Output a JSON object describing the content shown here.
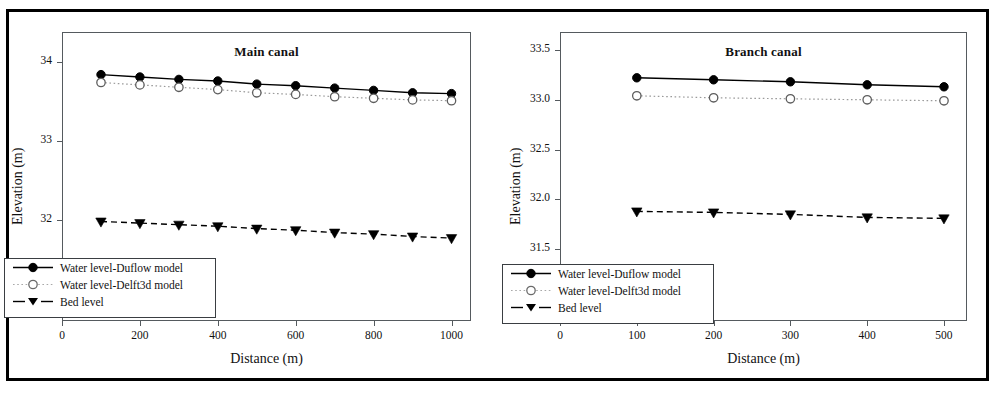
{
  "figure": {
    "panels": [
      {
        "key": "main",
        "title": "Main canal",
        "xlabel": "Distance (m)",
        "ylabel": "Elevation (m)",
        "xticks": [
          "0",
          "200",
          "400",
          "600",
          "800",
          "1000"
        ],
        "yticks": [
          "31",
          "32",
          "33",
          "34"
        ],
        "legend": [
          "Water level-Duflow model",
          "Water level-Delft3d model",
          "Bed level"
        ]
      },
      {
        "key": "branch",
        "title": "Branch canal",
        "xlabel": "Distance (m)",
        "ylabel": "Elevation (m)",
        "xticks": [
          "0",
          "100",
          "200",
          "300",
          "400",
          "500"
        ],
        "yticks": [
          "31.0",
          "31.5",
          "32.0",
          "32.5",
          "33.0",
          "33.5"
        ],
        "legend": [
          "Water level-Duflow model",
          "Water level-Delft3d model",
          "Bed level"
        ]
      }
    ]
  },
  "colors": {
    "ink": "#111111",
    "frame": "#555a5e",
    "outer_frame": "#000000",
    "series_duflow": "#000000",
    "series_delft3d": "#9a9a9a",
    "series_bed": "#000000",
    "background": "#ffffff"
  },
  "chart_data": [
    {
      "type": "line",
      "title": "Main canal",
      "xlabel": "Distance (m)",
      "ylabel": "Elevation (m)",
      "xlim": [
        0,
        1050
      ],
      "ylim": [
        30.72,
        34.38
      ],
      "xticks": [
        0,
        200,
        400,
        600,
        800,
        1000
      ],
      "yticks": [
        31,
        32,
        33,
        34
      ],
      "grid": false,
      "legend_position": "lower-left",
      "x": [
        100,
        200,
        300,
        400,
        500,
        600,
        700,
        800,
        900,
        1000
      ],
      "series": [
        {
          "name": "Water level-Duflow model",
          "marker": "filled-circle",
          "linestyle": "solid",
          "values": [
            33.84,
            33.81,
            33.78,
            33.76,
            33.72,
            33.7,
            33.67,
            33.64,
            33.61,
            33.6
          ]
        },
        {
          "name": "Water level-Delft3d model",
          "marker": "open-circle",
          "linestyle": "dotted",
          "values": [
            33.74,
            33.71,
            33.68,
            33.65,
            33.61,
            33.59,
            33.56,
            33.54,
            33.52,
            33.51
          ]
        },
        {
          "name": "Bed level",
          "marker": "filled-triangle-down",
          "linestyle": "dashed",
          "values": [
            31.98,
            31.96,
            31.94,
            31.92,
            31.89,
            31.87,
            31.84,
            31.82,
            31.79,
            31.77
          ]
        }
      ]
    },
    {
      "type": "line",
      "title": "Branch canal",
      "xlabel": "Distance (m)",
      "ylabel": "Elevation (m)",
      "xlim": [
        0,
        530
      ],
      "ylim": [
        30.78,
        33.68
      ],
      "xticks": [
        0,
        100,
        200,
        300,
        400,
        500
      ],
      "yticks": [
        31.0,
        31.5,
        32.0,
        32.5,
        33.0,
        33.5
      ],
      "grid": false,
      "legend_position": "lower-left",
      "x": [
        100,
        200,
        300,
        400,
        500
      ],
      "series": [
        {
          "name": "Water level-Duflow model",
          "marker": "filled-circle",
          "linestyle": "solid",
          "values": [
            33.22,
            33.2,
            33.18,
            33.15,
            33.13
          ]
        },
        {
          "name": "Water level-Delft3d model",
          "marker": "open-circle",
          "linestyle": "dotted",
          "values": [
            33.04,
            33.02,
            33.01,
            33.0,
            32.99
          ]
        },
        {
          "name": "Bed level",
          "marker": "filled-triangle-down",
          "linestyle": "dashed",
          "values": [
            31.88,
            31.87,
            31.85,
            31.82,
            31.81
          ]
        }
      ]
    }
  ]
}
